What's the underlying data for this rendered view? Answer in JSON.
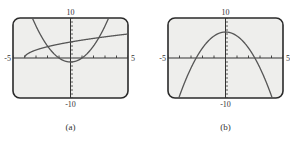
{
  "chart_data": [
    {
      "type": "line",
      "panel": "a",
      "caption": "(a)",
      "xlim": [
        -5,
        5
      ],
      "ylim": [
        -10,
        10
      ],
      "x_tick_labels": {
        "min": "-5",
        "max": "5"
      },
      "y_tick_labels": {
        "min": "-10",
        "max": "10"
      },
      "x_ticks_step": 1,
      "y_ticks_step": 1,
      "grid": false,
      "series": [
        {
          "name": "parabola",
          "description": "upward parabola, vertex near (0,-1)",
          "x": [
            -3.3,
            -2,
            -1,
            0,
            1,
            2,
            3.3
          ],
          "y": [
            9.9,
            3,
            0,
            -1,
            0,
            3,
            9.9
          ]
        },
        {
          "name": "square-root curve",
          "description": "starts at (-4,0) rising to the right",
          "x": [
            -4,
            -3,
            -2,
            0,
            2,
            5
          ],
          "y": [
            0,
            2,
            2.8,
            4,
            4.9,
            6
          ]
        }
      ]
    },
    {
      "type": "line",
      "panel": "b",
      "caption": "(b)",
      "xlim": [
        -5,
        5
      ],
      "ylim": [
        -10,
        10
      ],
      "x_tick_labels": {
        "min": "-5",
        "max": "5"
      },
      "y_tick_labels": {
        "min": "-10",
        "max": "10"
      },
      "x_ticks_step": 1,
      "y_ticks_step": 1,
      "grid": false,
      "series": [
        {
          "name": "downward parabola",
          "description": "vertex near (0,6.5)",
          "x": [
            -4,
            -3,
            -2.5,
            0,
            2.5,
            3,
            4
          ],
          "y": [
            -9.5,
            -2.5,
            0,
            6.5,
            0,
            -2.5,
            -9.5
          ]
        }
      ]
    }
  ],
  "labels": {
    "a": {
      "top": "10",
      "bottom": "-10",
      "left": "-5",
      "right": "5",
      "caption": "(a)"
    },
    "b": {
      "top": "10",
      "bottom": "-10",
      "left": "-5",
      "right": "5",
      "caption": "(b)"
    }
  },
  "colors": {
    "frame": "#2a2a2a",
    "screen": "#eeeeec",
    "curve": "#555555",
    "axis": "#333333"
  }
}
